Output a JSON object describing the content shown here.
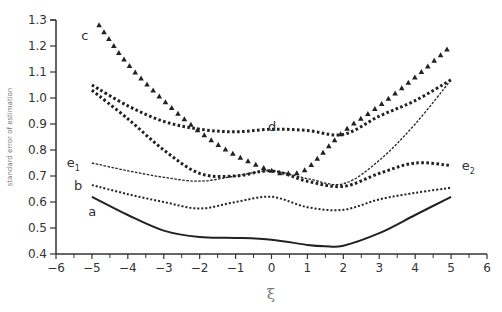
{
  "chart_data": {
    "type": "line",
    "title": "",
    "xlabel": "ξ",
    "ylabel": "standard error of estimation",
    "xlim": [
      -6,
      6
    ],
    "ylim": [
      0.4,
      1.3
    ],
    "xticks": [
      -6,
      -5,
      -4,
      -3,
      -2,
      -1,
      0,
      1,
      2,
      3,
      4,
      5,
      6
    ],
    "xtick_labels": [
      "−6",
      "−5",
      "−4",
      "−3",
      "−2",
      "−1",
      "0",
      "1",
      "2",
      "3",
      "4",
      "5",
      "6"
    ],
    "yticks": [
      0.4,
      0.5,
      0.6,
      0.7,
      0.8,
      0.9,
      1.0,
      1.1,
      1.2,
      1.3
    ],
    "ytick_labels": [
      "0.4",
      "0.5",
      "0.6",
      "0.7",
      "0.8",
      "0.9",
      "1.0",
      "1.1",
      "1.2",
      "1.3"
    ],
    "grid": false,
    "legend": "none (inline curve labels)",
    "series": [
      {
        "name": "a",
        "style": "solid",
        "x": [
          -5,
          -4,
          -3,
          -2,
          -1,
          0,
          1,
          1.5,
          2,
          3,
          4,
          5
        ],
        "y": [
          0.62,
          0.55,
          0.49,
          0.465,
          0.462,
          0.455,
          0.435,
          0.43,
          0.432,
          0.48,
          0.55,
          0.62
        ]
      },
      {
        "name": "b",
        "style": "dotted",
        "x": [
          -5,
          -4,
          -3,
          -2,
          -1,
          0,
          1,
          2,
          3,
          4,
          5
        ],
        "y": [
          0.665,
          0.63,
          0.6,
          0.575,
          0.6,
          0.62,
          0.58,
          0.57,
          0.61,
          0.635,
          0.655
        ]
      },
      {
        "name": "c",
        "style": "triangles",
        "x": [
          -4.8,
          -4,
          -3,
          -2,
          -1,
          0,
          0.5,
          1,
          2,
          3,
          4,
          5
        ],
        "y": [
          1.28,
          1.13,
          0.99,
          0.87,
          0.78,
          0.72,
          0.71,
          0.73,
          0.87,
          0.97,
          1.08,
          1.2
        ]
      },
      {
        "name": "d",
        "style": "square-dots",
        "x": [
          -5,
          -4,
          -3,
          -2,
          -1,
          0,
          1,
          2,
          3,
          4,
          5
        ],
        "y": [
          1.05,
          0.97,
          0.91,
          0.88,
          0.87,
          0.88,
          0.875,
          0.86,
          0.93,
          0.99,
          1.07
        ]
      },
      {
        "name": "e1",
        "style": "fine-dashed",
        "x": [
          -5,
          -4,
          -3,
          -2,
          -1,
          0,
          1,
          2,
          3,
          4,
          5
        ],
        "y": [
          0.75,
          0.72,
          0.695,
          0.68,
          0.7,
          0.72,
          0.69,
          0.67,
          0.76,
          0.9,
          1.07
        ]
      },
      {
        "name": "e2",
        "style": "square-dots",
        "x": [
          -5,
          -4,
          -3,
          -2,
          -1,
          0,
          1,
          2,
          3,
          4,
          5
        ],
        "y": [
          1.03,
          0.92,
          0.8,
          0.71,
          0.7,
          0.72,
          0.68,
          0.66,
          0.71,
          0.75,
          0.74
        ]
      }
    ],
    "annotations": [
      {
        "text": "c",
        "x": -5.3,
        "y": 1.24
      },
      {
        "text": "d",
        "x": -0.1,
        "y": 0.89
      },
      {
        "text": "e",
        "sub": "1",
        "x": -5.7,
        "y": 0.75
      },
      {
        "text": "b",
        "x": -5.5,
        "y": 0.66
      },
      {
        "text": "a",
        "x": -5.1,
        "y": 0.56
      },
      {
        "text": "e",
        "sub": "2",
        "x": 5.3,
        "y": 0.74
      }
    ]
  }
}
